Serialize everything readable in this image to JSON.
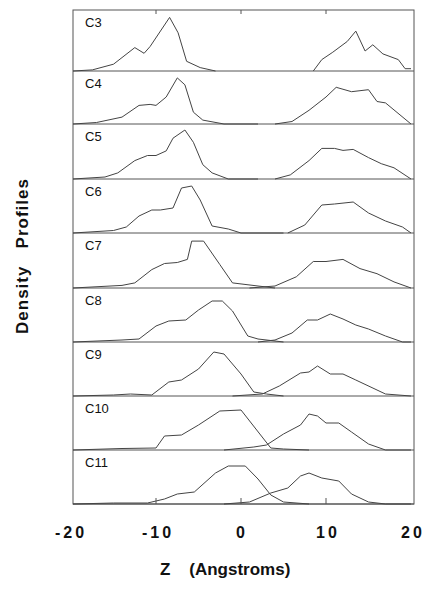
{
  "chart_data": {
    "type": "line",
    "title": "",
    "xlabel": "Z    (Angstroms)",
    "ylabel": "Density   Profiles",
    "xlim": [
      -20,
      20
    ],
    "xticks": [
      -20,
      -10,
      0,
      10,
      20
    ],
    "xtick_labels": [
      "-20",
      "-10",
      "0",
      "10",
      "20"
    ],
    "grid": false,
    "legend": null,
    "layout": "stacked panels, one per chain length, each with two density peaks (one per leaflet)",
    "panels": [
      {
        "name": "C3",
        "left": [
          [
            -20,
            0
          ],
          [
            -17.5,
            0.02
          ],
          [
            -15,
            0.12
          ],
          [
            -12.5,
            0.41
          ],
          [
            -11.4,
            0.31
          ],
          [
            -10.7,
            0.43
          ],
          [
            -8.4,
            0.94
          ],
          [
            -7.4,
            0.67
          ],
          [
            -6.4,
            0.17
          ],
          [
            -4.8,
            0.06
          ],
          [
            -3,
            0
          ]
        ],
        "right": [
          [
            8.5,
            0
          ],
          [
            9.5,
            0.2
          ],
          [
            10.8,
            0.33
          ],
          [
            12.5,
            0.52
          ],
          [
            13.5,
            0.7
          ],
          [
            14.6,
            0.35
          ],
          [
            15.5,
            0.46
          ],
          [
            16.7,
            0.3
          ],
          [
            18.5,
            0.2
          ],
          [
            19.3,
            0.04
          ],
          [
            20,
            0.04
          ]
        ]
      },
      {
        "name": "C4",
        "left": [
          [
            -20,
            0
          ],
          [
            -17,
            0.03
          ],
          [
            -14,
            0.14
          ],
          [
            -12,
            0.38
          ],
          [
            -10.7,
            0.4
          ],
          [
            -10,
            0.38
          ],
          [
            -8.8,
            0.55
          ],
          [
            -7.5,
            0.94
          ],
          [
            -6.6,
            0.8
          ],
          [
            -5.6,
            0.24
          ],
          [
            -4.5,
            0.08
          ],
          [
            -2,
            0
          ],
          [
            2,
            0
          ]
        ],
        "right": [
          [
            4,
            0
          ],
          [
            6,
            0.05
          ],
          [
            8,
            0.28
          ],
          [
            10,
            0.55
          ],
          [
            11.2,
            0.75
          ],
          [
            13,
            0.66
          ],
          [
            15,
            0.7
          ],
          [
            16,
            0.46
          ],
          [
            17,
            0.43
          ],
          [
            20,
            0
          ]
        ]
      },
      {
        "name": "C5",
        "left": [
          [
            -20,
            0
          ],
          [
            -16,
            0.04
          ],
          [
            -14.5,
            0.12
          ],
          [
            -12.5,
            0.36
          ],
          [
            -11,
            0.46
          ],
          [
            -10,
            0.46
          ],
          [
            -8.8,
            0.55
          ],
          [
            -8,
            0.8
          ],
          [
            -6.6,
            0.96
          ],
          [
            -5.6,
            0.72
          ],
          [
            -4.5,
            0.28
          ],
          [
            -3.4,
            0.12
          ],
          [
            -1.5,
            0
          ],
          [
            2,
            0
          ]
        ],
        "right": [
          [
            4,
            0
          ],
          [
            5.8,
            0.08
          ],
          [
            8,
            0.36
          ],
          [
            9.5,
            0.6
          ],
          [
            11,
            0.6
          ],
          [
            12,
            0.56
          ],
          [
            13.2,
            0.58
          ],
          [
            15,
            0.42
          ],
          [
            16.5,
            0.3
          ],
          [
            18,
            0.22
          ],
          [
            20,
            0
          ]
        ]
      },
      {
        "name": "C6",
        "left": [
          [
            -20,
            0
          ],
          [
            -15,
            0.05
          ],
          [
            -13.5,
            0.12
          ],
          [
            -12,
            0.34
          ],
          [
            -10.5,
            0.46
          ],
          [
            -9.5,
            0.46
          ],
          [
            -8,
            0.5
          ],
          [
            -7,
            0.9
          ],
          [
            -5.8,
            0.94
          ],
          [
            -4.8,
            0.66
          ],
          [
            -3.4,
            0.14
          ],
          [
            -1.5,
            0.08
          ],
          [
            0,
            0
          ],
          [
            5,
            0
          ]
        ],
        "right": [
          [
            5.5,
            0
          ],
          [
            7.5,
            0.16
          ],
          [
            9.5,
            0.56
          ],
          [
            11,
            0.58
          ],
          [
            13.2,
            0.62
          ],
          [
            15,
            0.4
          ],
          [
            17,
            0.24
          ],
          [
            19,
            0.12
          ],
          [
            20,
            0
          ]
        ]
      },
      {
        "name": "C7",
        "left": [
          [
            -20,
            0
          ],
          [
            -14,
            0.05
          ],
          [
            -12.5,
            0.1
          ],
          [
            -10.5,
            0.36
          ],
          [
            -9,
            0.48
          ],
          [
            -7.5,
            0.5
          ],
          [
            -6.3,
            0.56
          ],
          [
            -5.8,
            0.92
          ],
          [
            -4.4,
            0.92
          ],
          [
            -2.5,
            0.46
          ],
          [
            -1,
            0.1
          ],
          [
            2,
            0.04
          ],
          [
            4,
            0
          ]
        ],
        "right": [
          [
            1,
            0
          ],
          [
            4,
            0.04
          ],
          [
            6.5,
            0.22
          ],
          [
            8.5,
            0.52
          ],
          [
            10,
            0.52
          ],
          [
            12,
            0.56
          ],
          [
            14,
            0.38
          ],
          [
            16,
            0.28
          ],
          [
            18,
            0.12
          ],
          [
            20,
            0
          ]
        ]
      },
      {
        "name": "C8",
        "left": [
          [
            -20,
            0
          ],
          [
            -14,
            0.04
          ],
          [
            -12,
            0.06
          ],
          [
            -10,
            0.32
          ],
          [
            -8.5,
            0.42
          ],
          [
            -6.5,
            0.44
          ],
          [
            -5,
            0.64
          ],
          [
            -3.4,
            0.82
          ],
          [
            -2.2,
            0.82
          ],
          [
            -1,
            0.62
          ],
          [
            0.8,
            0.12
          ],
          [
            2,
            0.06
          ],
          [
            5,
            0
          ]
        ],
        "right": [
          [
            2,
            0
          ],
          [
            4,
            0.04
          ],
          [
            6,
            0.18
          ],
          [
            7.8,
            0.44
          ],
          [
            9,
            0.44
          ],
          [
            10.5,
            0.56
          ],
          [
            12,
            0.46
          ],
          [
            13.5,
            0.34
          ],
          [
            15,
            0.26
          ],
          [
            17,
            0.12
          ],
          [
            19,
            0
          ],
          [
            20,
            0
          ]
        ]
      },
      {
        "name": "C9",
        "left": [
          [
            -20,
            0
          ],
          [
            -15,
            0.02
          ],
          [
            -13,
            0.04
          ],
          [
            -10.5,
            0.02
          ],
          [
            -8.5,
            0.28
          ],
          [
            -7,
            0.32
          ],
          [
            -5,
            0.54
          ],
          [
            -3.2,
            0.88
          ],
          [
            -2,
            0.84
          ],
          [
            0,
            0.44
          ],
          [
            1.5,
            0.08
          ],
          [
            3,
            0.04
          ],
          [
            5,
            0
          ]
        ],
        "right": [
          [
            -1,
            0
          ],
          [
            2.5,
            0.04
          ],
          [
            4.5,
            0.2
          ],
          [
            7,
            0.46
          ],
          [
            8,
            0.48
          ],
          [
            9,
            0.6
          ],
          [
            10.5,
            0.44
          ],
          [
            12,
            0.44
          ],
          [
            13.5,
            0.32
          ],
          [
            16,
            0.12
          ],
          [
            17,
            0.04
          ],
          [
            20,
            0
          ]
        ]
      },
      {
        "name": "C10",
        "left": [
          [
            -20,
            0
          ],
          [
            -14,
            0.03
          ],
          [
            -10,
            0.04
          ],
          [
            -9,
            0.28
          ],
          [
            -7,
            0.3
          ],
          [
            -5,
            0.5
          ],
          [
            -2.5,
            0.78
          ],
          [
            0,
            0.8
          ],
          [
            2.3,
            0.3
          ],
          [
            3.5,
            0.04
          ],
          [
            5,
            0.02
          ],
          [
            8,
            0
          ]
        ],
        "right": [
          [
            -2,
            0
          ],
          [
            1.5,
            0.06
          ],
          [
            3,
            0.1
          ],
          [
            5,
            0.32
          ],
          [
            7,
            0.5
          ],
          [
            8,
            0.72
          ],
          [
            9,
            0.68
          ],
          [
            10,
            0.54
          ],
          [
            11.5,
            0.54
          ],
          [
            13,
            0.36
          ],
          [
            15,
            0.12
          ],
          [
            17,
            0
          ],
          [
            20,
            0
          ]
        ]
      },
      {
        "name": "C11",
        "left": [
          [
            -20,
            0
          ],
          [
            -15,
            0.02
          ],
          [
            -11,
            0.02
          ],
          [
            -9,
            0.1
          ],
          [
            -7.5,
            0.2
          ],
          [
            -5.5,
            0.24
          ],
          [
            -3,
            0.62
          ],
          [
            -1.5,
            0.76
          ],
          [
            0.5,
            0.76
          ],
          [
            2,
            0.5
          ],
          [
            3.5,
            0.18
          ],
          [
            5,
            0.04
          ],
          [
            8,
            0
          ]
        ],
        "right": [
          [
            -2,
            0
          ],
          [
            1,
            0.04
          ],
          [
            3.5,
            0.22
          ],
          [
            5.5,
            0.32
          ],
          [
            7,
            0.56
          ],
          [
            8,
            0.62
          ],
          [
            9.5,
            0.52
          ],
          [
            11.5,
            0.46
          ],
          [
            13,
            0.2
          ],
          [
            15,
            0.04
          ],
          [
            17,
            0
          ],
          [
            20,
            0
          ]
        ]
      }
    ]
  },
  "axes": {
    "ylabel": "Density   Profiles",
    "xlabel": "Z    (Angstroms)",
    "xtick_labels": [
      "-20",
      "-10",
      "0",
      "10",
      "20"
    ]
  },
  "colors": {
    "line": "#444444",
    "frame": "#555555",
    "text": "#111111"
  }
}
